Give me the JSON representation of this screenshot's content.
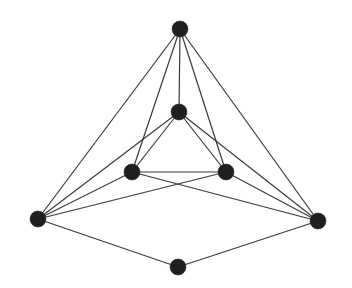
{
  "diagram": {
    "type": "graph",
    "colors": {
      "edge": "#3a3a3a",
      "node": "#1f1f1f",
      "background": "#ffffff"
    },
    "node_radius": 8,
    "nodes": [
      {
        "id": "top",
        "x": 180,
        "y": 29
      },
      {
        "id": "center",
        "x": 179,
        "y": 112
      },
      {
        "id": "left-mid",
        "x": 132,
        "y": 172
      },
      {
        "id": "right-mid",
        "x": 226,
        "y": 172
      },
      {
        "id": "left",
        "x": 38,
        "y": 219
      },
      {
        "id": "right",
        "x": 318,
        "y": 221
      },
      {
        "id": "bottom",
        "x": 178,
        "y": 267
      }
    ],
    "edges": [
      [
        "top",
        "left"
      ],
      [
        "top",
        "right"
      ],
      [
        "top",
        "center"
      ],
      [
        "top",
        "left-mid"
      ],
      [
        "top",
        "right-mid"
      ],
      [
        "center",
        "left-mid"
      ],
      [
        "center",
        "right-mid"
      ],
      [
        "center",
        "left"
      ],
      [
        "center",
        "right"
      ],
      [
        "left-mid",
        "right-mid"
      ],
      [
        "left",
        "left-mid"
      ],
      [
        "left",
        "right-mid"
      ],
      [
        "right",
        "left-mid"
      ],
      [
        "right",
        "right-mid"
      ],
      [
        "left",
        "bottom"
      ],
      [
        "right",
        "bottom"
      ]
    ]
  }
}
